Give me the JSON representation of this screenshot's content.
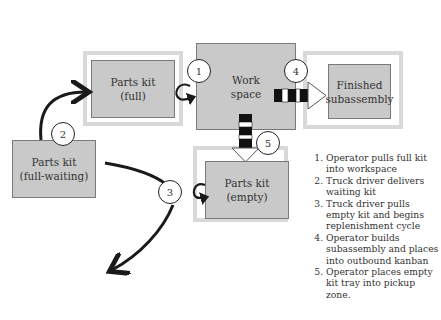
{
  "diagram": {
    "boxes": {
      "parts_kit_full": "Parts kit\n(full)",
      "work_space": "Work\nspace",
      "finished_subassembly": "Finished\nsubassembly",
      "parts_kit_full_waiting": "Parts kit\n(full-waiting)",
      "parts_kit_empty": "Parts kit\n(empty)"
    },
    "box_lines": {
      "parts_kit_full": [
        "Parts kit",
        "(full)"
      ],
      "work_space": [
        "Work",
        "space"
      ],
      "finished_subassembly": [
        "Finished",
        "subassembly"
      ],
      "parts_kit_full_waiting": [
        "Parts kit",
        "(full-waiting)"
      ],
      "parts_kit_empty": [
        "Parts kit",
        "(empty)"
      ]
    },
    "step_markers": [
      "1",
      "2",
      "3",
      "4",
      "5"
    ],
    "colors": {
      "box_fill": "#c9c9c9",
      "box_border": "#7a7a7a",
      "zone_border": "#d9d9d9",
      "arrow": "#1a1a1a"
    }
  },
  "legend": {
    "items": [
      "Operator pulls full kit into workspace",
      "Truck driver delivers waiting kit",
      "Truck driver pulls empty kit and begins replenishment cycle",
      "Operator builds subassembly and places into outbound kanban",
      "Operator places empty kit tray into pickup zone."
    ]
  }
}
